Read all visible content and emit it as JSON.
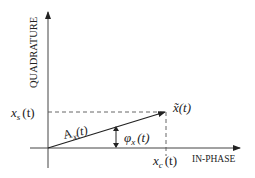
{
  "diagram": {
    "axes": {
      "vertical_label": "QUADRATURE",
      "horizontal_label": "IN-PHASE"
    },
    "labels": {
      "quadrature_component": "x",
      "quadrature_sub": "s",
      "in_phase_component": "x",
      "in_phase_sub": "c",
      "time_arg": "(t)",
      "amplitude": "A",
      "amplitude_sub": "x",
      "phase": "φ",
      "phase_sub": "x",
      "phasor": "x̃(t)"
    },
    "colors": {
      "line": "#222222",
      "background": "#ffffff"
    }
  }
}
